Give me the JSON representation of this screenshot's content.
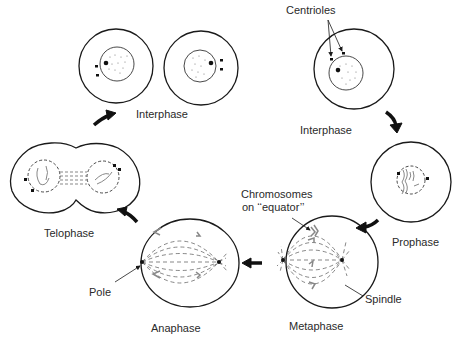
{
  "diagram": {
    "stages": [
      {
        "id": "interphase-daughters",
        "label": "Interphase"
      },
      {
        "id": "interphase",
        "label": "Interphase"
      },
      {
        "id": "prophase",
        "label": "Prophase"
      },
      {
        "id": "metaphase",
        "label": "Metaphase"
      },
      {
        "id": "anaphase",
        "label": "Anaphase"
      },
      {
        "id": "telophase",
        "label": "Telophase"
      }
    ],
    "annotations": {
      "centrioles": "Centrioles",
      "chromosomes_line1": "Chromosomes",
      "chromosomes_line2": "on ‘‘equator’’",
      "spindle": "Spindle",
      "pole": "Pole"
    },
    "flow": [
      "interphase",
      "prophase",
      "metaphase",
      "anaphase",
      "telophase",
      "interphase-daughters"
    ],
    "colors": {
      "stroke": "#1a1a1a",
      "dashed": "#555555",
      "chromosome": "#888888",
      "text": "#2a2a2a"
    }
  }
}
